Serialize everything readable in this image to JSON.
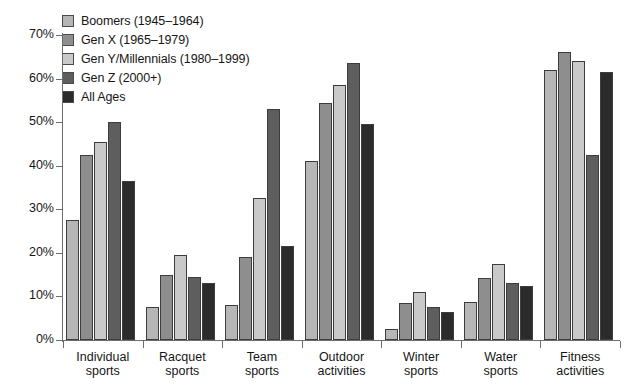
{
  "chart_data": {
    "type": "bar",
    "title": "",
    "subtitle": "",
    "xlabel": "",
    "ylabel": "",
    "ylim": [
      0,
      70
    ],
    "ytick_labels": [
      "0%",
      "10%",
      "20%",
      "30%",
      "40%",
      "50%",
      "60%",
      "70%"
    ],
    "ytick_values": [
      0,
      10,
      20,
      30,
      40,
      50,
      60,
      70
    ],
    "grid": false,
    "legend_position": "top-left",
    "value_unit": "%",
    "categories": [
      "Individual sports",
      "Racquet sports",
      "Team sports",
      "Outdoor activities",
      "Winter sports",
      "Water sports",
      "Fitness activities"
    ],
    "category_lines": [
      [
        "Individual",
        "sports"
      ],
      [
        "Racquet",
        "sports"
      ],
      [
        "Team",
        "sports"
      ],
      [
        "Outdoor",
        "activities"
      ],
      [
        "Winter",
        "sports"
      ],
      [
        "Water",
        "sports"
      ],
      [
        "Fitness",
        "activities"
      ]
    ],
    "series": [
      {
        "name": "Boomers (1945–1964)",
        "color": "#b6b6b6",
        "values": [
          27.5,
          7.5,
          8.0,
          41.0,
          2.5,
          8.8,
          62.0
        ]
      },
      {
        "name": "Gen X (1965–1979)",
        "color": "#8e8e8e",
        "values": [
          42.5,
          15.0,
          19.0,
          54.5,
          8.5,
          14.2,
          66.0
        ]
      },
      {
        "name": "Gen Y/Millennials (1980–1999)",
        "color": "#c9c9c9",
        "values": [
          45.5,
          19.5,
          32.5,
          58.5,
          11.0,
          17.5,
          64.0
        ]
      },
      {
        "name": "Gen Z (2000+)",
        "color": "#5e5e5e",
        "values": [
          50.0,
          14.5,
          53.0,
          63.5,
          7.5,
          13.0,
          42.5
        ]
      },
      {
        "name": "All Ages",
        "color": "#2b2b2b",
        "values": [
          36.5,
          13.0,
          21.5,
          49.5,
          6.5,
          12.5,
          61.5
        ]
      }
    ]
  },
  "legend": {
    "items": [
      {
        "label": "Boomers (1945–1964)",
        "color": "#b6b6b6"
      },
      {
        "label": "Gen X (1965–1979)",
        "color": "#8e8e8e"
      },
      {
        "label": "Gen Y/Millennials (1980–1999)",
        "color": "#c9c9c9"
      },
      {
        "label": "Gen Z (2000+)",
        "color": "#5e5e5e"
      },
      {
        "label": "All Ages",
        "color": "#2b2b2b"
      }
    ]
  },
  "axis": {
    "line_color": "#6e6e6e",
    "text_color": "#161616"
  }
}
